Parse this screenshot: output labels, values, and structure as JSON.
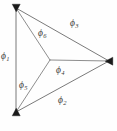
{
  "diagram": {
    "type": "graph-node-link",
    "background_color": "#fefefe",
    "line_color": "#6b6b6b",
    "vertex_color": "#1a1a1a",
    "label_color": "#3a3a3a",
    "vertices": [
      {
        "id": "top-left",
        "name": "vertex-top-left",
        "x": 16,
        "y": 8
      },
      {
        "id": "bottom-left",
        "name": "vertex-bottom-left",
        "x": 16,
        "y": 112
      },
      {
        "id": "right",
        "name": "vertex-right",
        "x": 109,
        "y": 61
      },
      {
        "id": "hub",
        "name": "vertex-center-hub",
        "x": 50,
        "y": 60
      }
    ],
    "edges": [
      {
        "id": "e1",
        "from": "top-left",
        "to": "bottom-left",
        "label": "ϕ",
        "subscript": "1",
        "kind": "outer"
      },
      {
        "id": "e2",
        "from": "bottom-left",
        "to": "right",
        "label": "ϕ",
        "subscript": "2",
        "kind": "outer"
      },
      {
        "id": "e3",
        "from": "top-left",
        "to": "right",
        "label": "ϕ",
        "subscript": "3",
        "kind": "outer"
      },
      {
        "id": "e4",
        "from": "hub",
        "to": "right",
        "label": "ϕ",
        "subscript": "4",
        "kind": "spoke"
      },
      {
        "id": "e5",
        "from": "hub",
        "to": "bottom-left",
        "label": "ϕ",
        "subscript": "5",
        "kind": "spoke"
      },
      {
        "id": "e6",
        "from": "hub",
        "to": "top-left",
        "label": "ϕ",
        "subscript": "6",
        "kind": "spoke"
      }
    ],
    "labels": {
      "phi1": {
        "symbol": "ϕ",
        "subscript": "1"
      },
      "phi2": {
        "symbol": "ϕ",
        "subscript": "2"
      },
      "phi3": {
        "symbol": "ϕ",
        "subscript": "3"
      },
      "phi4": {
        "symbol": "ϕ",
        "subscript": "4"
      },
      "phi5": {
        "symbol": "ϕ",
        "subscript": "5"
      },
      "phi6": {
        "symbol": "ϕ",
        "subscript": "6"
      }
    }
  }
}
